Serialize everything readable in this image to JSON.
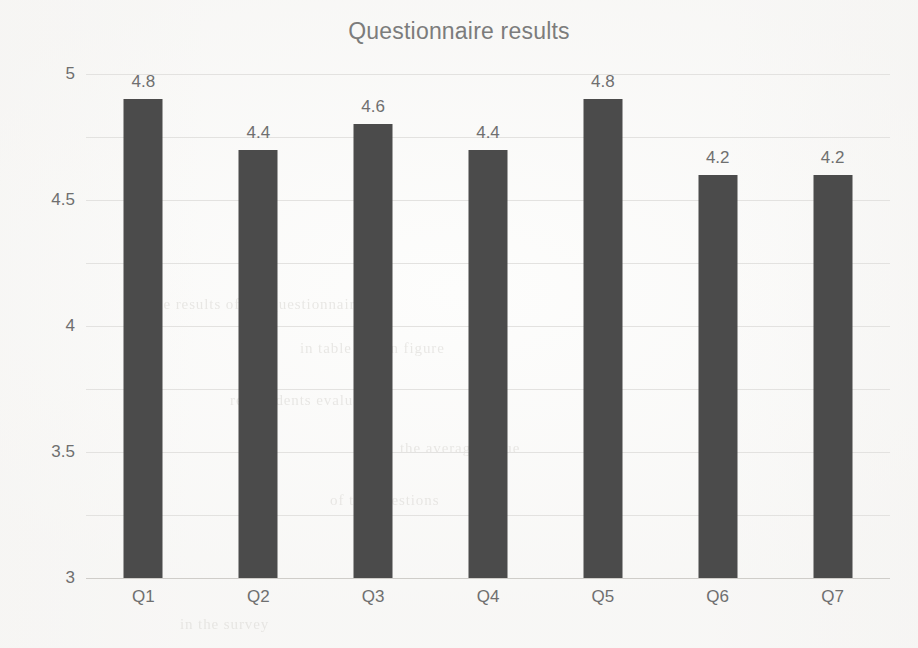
{
  "chart_data": {
    "type": "bar",
    "title": "Questionnaire results",
    "xlabel": "",
    "ylabel": "",
    "categories": [
      "Q1",
      "Q2",
      "Q3",
      "Q4",
      "Q5",
      "Q6",
      "Q7"
    ],
    "values": [
      4.8,
      4.4,
      4.6,
      4.4,
      4.8,
      4.2,
      4.2
    ],
    "data_labels": [
      "4.8",
      "4.4",
      "4.6",
      "4.4",
      "4.8",
      "4.2",
      "4.2"
    ],
    "ylim": [
      1,
      5
    ],
    "y_ticks": [
      5,
      4.5,
      4,
      3.5,
      3,
      2.5,
      2,
      1.5,
      1
    ],
    "y_tick_labels": [
      "5",
      "4.5",
      "4",
      "3.5",
      "3",
      "2.5",
      "2",
      "1.5",
      "1"
    ],
    "grid": true,
    "legend": false,
    "legend_position": "none",
    "bar_color": "#4b4b4b",
    "gridline_color": "#e3e2e0",
    "text_color": "#6f6f6f",
    "background_color": "#fdfdfc"
  },
  "scan_artifacts": {
    "description": "faint bleed-through text from reverse of scanned page",
    "lines": [
      "the results of the questionnaire",
      "in table and in figure",
      "respondents evaluated",
      "the average value",
      "of the questions",
      "in the survey"
    ]
  }
}
